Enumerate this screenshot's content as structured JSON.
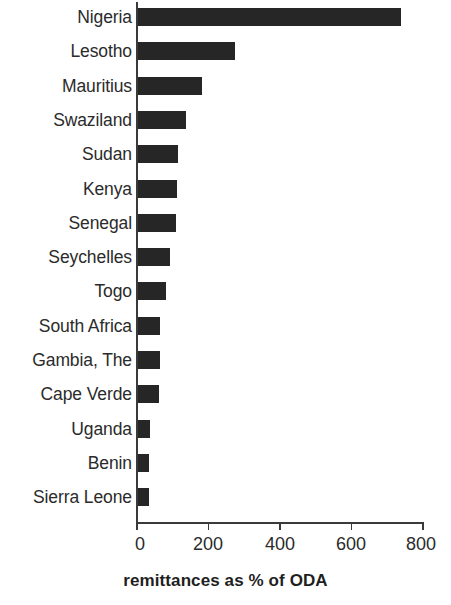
{
  "chart_data": {
    "type": "bar",
    "orientation": "horizontal",
    "title": "",
    "subtitle": "",
    "xlabel": "remittances as % of ODA",
    "ylabel": "",
    "xlim": [
      0,
      800
    ],
    "xticks": [
      0,
      200,
      400,
      600,
      800
    ],
    "xtick_labels": [
      "0",
      "200",
      "400",
      "600",
      "800"
    ],
    "grid": false,
    "legend": null,
    "bar_color": "#262626",
    "axis_color": "#3a3a3a",
    "categories": [
      "Nigeria",
      "Lesotho",
      "Mauritius",
      "Swaziland",
      "Sudan",
      "Kenya",
      "Senegal",
      "Seychelles",
      "Togo",
      "South Africa",
      "Gambia, The",
      "Cape Verde",
      "Uganda",
      "Benin",
      "Sierra Leone"
    ],
    "values": [
      740,
      275,
      180,
      135,
      113,
      110,
      108,
      90,
      80,
      63,
      62,
      60,
      35,
      32,
      32
    ],
    "series": [
      {
        "name": "remittances as % of ODA",
        "values": [
          740,
          275,
          180,
          135,
          113,
          110,
          108,
          90,
          80,
          63,
          62,
          60,
          35,
          32,
          32
        ]
      }
    ]
  },
  "axis": {
    "x_title": "remittances as % of ODA",
    "tick_0": "0",
    "tick_1": "200",
    "tick_2": "400",
    "tick_3": "600",
    "tick_4": "800"
  },
  "labels": {
    "c0": "Nigeria",
    "c1": "Lesotho",
    "c2": "Mauritius",
    "c3": "Swaziland",
    "c4": "Sudan",
    "c5": "Kenya",
    "c6": "Senegal",
    "c7": "Seychelles",
    "c8": "Togo",
    "c9": "South Africa",
    "c10": "Gambia, The",
    "c11": "Cape Verde",
    "c12": "Uganda",
    "c13": "Benin",
    "c14": "Sierra Leone"
  }
}
